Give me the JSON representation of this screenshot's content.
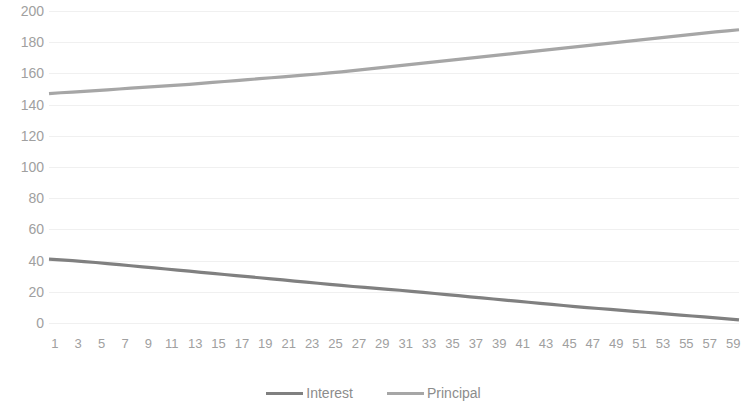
{
  "chart_data": {
    "type": "line",
    "title": "",
    "xlabel": "",
    "ylabel": "",
    "ylim": [
      0,
      200
    ],
    "ytick_step": 20,
    "yticks": [
      200,
      180,
      160,
      140,
      120,
      100,
      80,
      60,
      40,
      20,
      0
    ],
    "grid": true,
    "legend_position": "bottom",
    "x": [
      1,
      2,
      3,
      4,
      5,
      6,
      7,
      8,
      9,
      10,
      11,
      12,
      13,
      14,
      15,
      16,
      17,
      18,
      19,
      20,
      21,
      22,
      23,
      24,
      25,
      26,
      27,
      28,
      29,
      30,
      31,
      32,
      33,
      34,
      35,
      36,
      37,
      38,
      39,
      40,
      41,
      42,
      43,
      44,
      45,
      46,
      47,
      48,
      49,
      50,
      51,
      52,
      53,
      54,
      55,
      56,
      57,
      58,
      59,
      60
    ],
    "xticks": [
      1,
      3,
      5,
      7,
      9,
      11,
      13,
      15,
      17,
      19,
      21,
      23,
      25,
      27,
      29,
      31,
      33,
      35,
      37,
      39,
      41,
      43,
      45,
      47,
      49,
      51,
      53,
      55,
      57,
      59
    ],
    "series": [
      {
        "name": "Interest",
        "color": "#808080",
        "values": [
          41.0,
          40.5,
          40.0,
          39.4,
          38.8,
          38.1,
          37.4,
          36.7,
          36.0,
          35.3,
          34.6,
          33.9,
          33.2,
          32.5,
          31.8,
          31.1,
          30.4,
          29.7,
          29.0,
          28.3,
          27.6,
          26.9,
          26.2,
          25.5,
          24.8,
          24.1,
          23.4,
          22.8,
          22.2,
          21.6,
          21.0,
          20.3,
          19.6,
          18.9,
          18.2,
          17.5,
          16.8,
          16.1,
          15.4,
          14.7,
          14.0,
          13.3,
          12.6,
          11.9,
          11.2,
          10.5,
          9.9,
          9.3,
          8.7,
          8.1,
          7.5,
          6.9,
          6.3,
          5.7,
          5.1,
          4.5,
          3.9,
          3.3,
          2.7,
          2.0
        ]
      },
      {
        "name": "Principal",
        "color": "#a6a6a6",
        "values": [
          147.0,
          147.6,
          148.0,
          148.5,
          149.0,
          149.5,
          150.0,
          150.5,
          151.0,
          151.5,
          152.0,
          152.5,
          153.0,
          153.6,
          154.2,
          154.8,
          155.4,
          156.0,
          156.6,
          157.2,
          157.8,
          158.4,
          159.0,
          159.6,
          160.3,
          161.0,
          161.8,
          162.6,
          163.4,
          164.2,
          165.0,
          165.8,
          166.6,
          167.4,
          168.2,
          169.0,
          169.8,
          170.6,
          171.4,
          172.2,
          173.0,
          173.8,
          174.6,
          175.4,
          176.2,
          177.0,
          177.8,
          178.6,
          179.4,
          180.2,
          181.0,
          181.8,
          182.6,
          183.4,
          184.2,
          185.0,
          185.8,
          186.6,
          187.3,
          188.0
        ]
      }
    ]
  },
  "legend": {
    "entries": [
      {
        "label": "Interest"
      },
      {
        "label": "Principal"
      }
    ]
  },
  "colors": {
    "interest": "#808080",
    "principal": "#a6a6a6",
    "gridline": "#f0f0f0",
    "tick_text": "#a0a0a0",
    "legend_text": "#8c8c8c",
    "background": "#ffffff"
  }
}
